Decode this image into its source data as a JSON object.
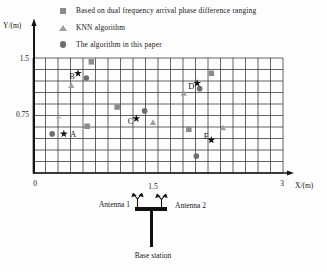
{
  "legend": {
    "items": [
      {
        "marker": "square",
        "label": "Based on dual frequency arrival phase difference ranging"
      },
      {
        "marker": "triangle",
        "label": "KNN algorithm"
      },
      {
        "marker": "circle",
        "label": "The algorithm in this paper"
      }
    ]
  },
  "axes": {
    "y_label": "Y/(m)",
    "x_label": "X/(m)",
    "y_tick_labels": [
      "1.5",
      "0.75"
    ],
    "x_tick_labels": [
      "0",
      "1.5",
      "3"
    ]
  },
  "chart_data": {
    "type": "scatter",
    "xlabel": "X/(m)",
    "ylabel": "Y/(m)",
    "xlim": [
      0,
      3
    ],
    "ylim": [
      0,
      1.5
    ],
    "x_tick_values": [
      0,
      1.5,
      3
    ],
    "y_tick_values": [
      0.75,
      1.5
    ],
    "grid": {
      "on": true,
      "cols": 20,
      "rows": 10
    },
    "legend_position": "top",
    "colors": {
      "grid": "#3d3d3d",
      "axis": "#141414"
    },
    "series": [
      {
        "name": "Based on dual frequency arrival phase difference ranging",
        "marker": "square",
        "color": "#8b8b8b",
        "points": [
          [
            0.7,
            1.45
          ],
          [
            1.01,
            0.86
          ],
          [
            0.65,
            0.61
          ],
          [
            2.14,
            1.3
          ],
          [
            1.87,
            0.57
          ]
        ]
      },
      {
        "name": "KNN algorithm",
        "marker": "triangle",
        "color": "#a0a0a0",
        "points": [
          [
            0.46,
            1.14
          ],
          [
            0.31,
            0.74,
            0.5
          ],
          [
            1.44,
            0.66
          ],
          [
            1.81,
            1.04
          ],
          [
            2.28,
            0.59
          ]
        ]
      },
      {
        "name": "The algorithm in this paper",
        "marker": "circle",
        "color": "#6e6e6e",
        "points": [
          [
            0.64,
            1.24
          ],
          [
            0.23,
            0.51
          ],
          [
            1.34,
            0.81
          ],
          [
            2.0,
            1.1
          ],
          [
            1.96,
            0.22
          ]
        ]
      },
      {
        "name": "",
        "marker": "star",
        "color": "#141414",
        "points": [
          [
            0.54,
            1.3
          ],
          [
            0.37,
            0.51
          ],
          [
            1.24,
            0.71
          ],
          [
            1.97,
            1.17
          ],
          [
            2.14,
            0.43
          ]
        ]
      }
    ],
    "point_labels": [
      {
        "text": "A",
        "x": 0.48,
        "y": 0.51
      },
      {
        "text": "B",
        "x": 0.47,
        "y": 1.27
      },
      {
        "text": "C",
        "x": 1.17,
        "y": 0.68
      },
      {
        "text": "D",
        "x": 1.9,
        "y": 1.14
      },
      {
        "text": "E",
        "x": 2.08,
        "y": 0.48
      }
    ]
  },
  "base_station": {
    "antenna1_label": "Antenna 1",
    "antenna2_label": "Antenna 2",
    "label": "Base station"
  }
}
